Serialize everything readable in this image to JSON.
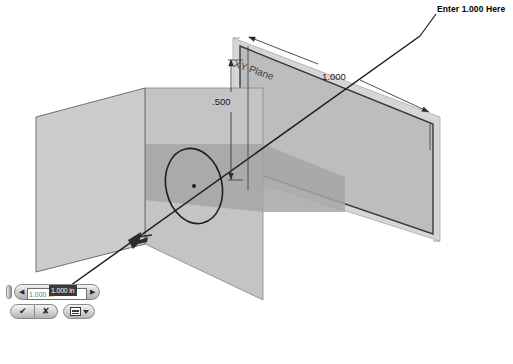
{
  "app": {
    "name": "SolidWorks 3D CAD viewport",
    "scene_description": "Isometric view of three reference planes with a sketched circle and a dimension being edited"
  },
  "annotation": {
    "callout_text": "Enter 1.000 Here",
    "leader_target": "dimension-value-input"
  },
  "viewport": {
    "plane_label": "XY Plane",
    "dimensions": [
      {
        "name": "width",
        "value": "1.000",
        "orientation": "horizontal"
      },
      {
        "name": "height",
        "value": ".500",
        "orientation": "vertical"
      }
    ],
    "colors": {
      "plane_light": "#c9c9c9",
      "plane_mid": "#bdbdbd",
      "plane_dark": "#a2a2a2",
      "outline": "#5e5e5e",
      "sketch_line": "#262626",
      "dim_line": "#3a3a3a",
      "background": "#ffffff"
    }
  },
  "modify_box": {
    "value": "1.000 in",
    "placeholder": "1.000 in",
    "spin_down_label": "◀",
    "spin_up_label": "▶",
    "grip_name": "drag-grip",
    "buttons": [
      {
        "name": "accept",
        "glyph": "✔"
      },
      {
        "name": "cancel",
        "glyph": "✘"
      },
      {
        "name": "options",
        "glyph": "list"
      }
    ]
  }
}
